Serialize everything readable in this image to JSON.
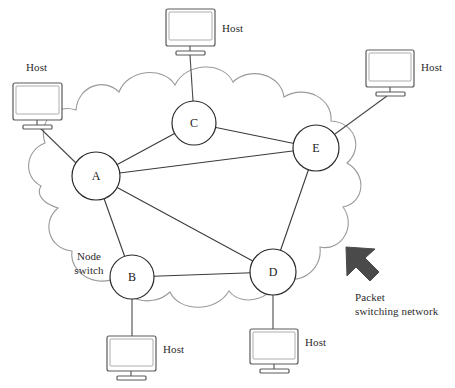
{
  "diagram": {
    "cloud_label": {
      "text_line1": "Packet",
      "text_line2": "switching network",
      "full": "Packet switching network"
    },
    "node_switch_label": {
      "text_line1": "Node",
      "text_line2": "switch",
      "full": "Node switch"
    },
    "colors": {
      "cloud_stroke": "#9a9a9a",
      "node_stroke": "#2b2b2b",
      "link_stroke": "#3a3a3a",
      "monitor_stroke": "#5a5a5a",
      "arrow_fill": "#4a4a4a",
      "text": "#2b2b2b",
      "background": "#ffffff"
    },
    "nodes": [
      {
        "id": "A",
        "label": "A",
        "cx": 96,
        "cy": 176,
        "r": 24
      },
      {
        "id": "B",
        "label": "B",
        "cx": 132,
        "cy": 277,
        "r": 22
      },
      {
        "id": "C",
        "label": "C",
        "cx": 194,
        "cy": 123,
        "r": 22
      },
      {
        "id": "D",
        "label": "D",
        "cx": 273,
        "cy": 272,
        "r": 23
      },
      {
        "id": "E",
        "label": "E",
        "cx": 316,
        "cy": 148,
        "r": 23
      }
    ],
    "links": [
      {
        "from": "A",
        "to": "C"
      },
      {
        "from": "A",
        "to": "E"
      },
      {
        "from": "A",
        "to": "B"
      },
      {
        "from": "A",
        "to": "D"
      },
      {
        "from": "C",
        "to": "E"
      },
      {
        "from": "E",
        "to": "D"
      },
      {
        "from": "B",
        "to": "D"
      }
    ],
    "hosts": [
      {
        "id": "host-top",
        "label": "Host",
        "attached_node": "C",
        "monitor": {
          "x": 166,
          "y": 9,
          "w": 49,
          "h": 37
        },
        "label_pos": {
          "x": 222,
          "y": 27
        },
        "stem": {
          "x1": 190,
          "y1": 55,
          "x2": 193,
          "y2": 101
        }
      },
      {
        "id": "host-left",
        "label": "Host",
        "attached_node": "A",
        "monitor": {
          "x": 13,
          "y": 83,
          "w": 49,
          "h": 37
        },
        "label_pos": {
          "x": 26,
          "y": 66
        },
        "stem": {
          "x1": 40,
          "y1": 128,
          "x2": 76,
          "y2": 164
        }
      },
      {
        "id": "host-right",
        "label": "Host",
        "attached_node": "E",
        "monitor": {
          "x": 366,
          "y": 50,
          "w": 48,
          "h": 37
        },
        "label_pos": {
          "x": 421,
          "y": 66
        },
        "stem": {
          "x1": 388,
          "y1": 96,
          "x2": 334,
          "y2": 134
        }
      },
      {
        "id": "host-bottom-left",
        "label": "Host",
        "attached_node": "B",
        "monitor": {
          "x": 107,
          "y": 335,
          "w": 49,
          "h": 37
        },
        "label_pos": {
          "x": 163,
          "y": 348
        },
        "stem": {
          "x1": 132,
          "y1": 299,
          "x2": 132,
          "y2": 335
        }
      },
      {
        "id": "host-bottom-right",
        "label": "Host",
        "attached_node": "D",
        "monitor": {
          "x": 250,
          "y": 328,
          "w": 48,
          "h": 37
        },
        "label_pos": {
          "x": 305,
          "y": 341
        },
        "stem": {
          "x1": 273,
          "y1": 295,
          "x2": 273,
          "y2": 328
        }
      }
    ],
    "arrow": {
      "name": "pointer-arrow",
      "direction": "up-left",
      "x": 345,
      "y": 246
    }
  }
}
